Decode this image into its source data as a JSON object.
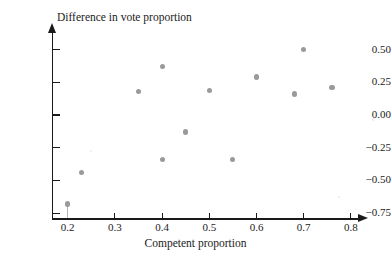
{
  "chart_data": {
    "type": "scatter",
    "title": "",
    "xlabel": "Competent proportion",
    "ylabel": "Difference in vote proportion",
    "xlim": [
      0.17,
      0.83
    ],
    "ylim": [
      -0.78,
      0.6
    ],
    "xticks": [
      "0.2",
      "0.3",
      "0.4",
      "0.5",
      "0.6",
      "0.7",
      "0.8"
    ],
    "xtick_values": [
      0.2,
      0.3,
      0.4,
      0.5,
      0.6,
      0.7,
      0.8
    ],
    "yticks": [
      "0.50",
      "0.25",
      "0.00",
      "−0.25",
      "−0.50",
      "−0.75"
    ],
    "ytick_values": [
      0.5,
      0.25,
      0.0,
      -0.25,
      -0.5,
      -0.75
    ],
    "grid": false,
    "legend": null,
    "marker_color": "#9a9a9e",
    "axis_color": "#1a1a1a",
    "points": [
      {
        "x": 0.2,
        "y": -0.68,
        "stem": true
      },
      {
        "x": 0.23,
        "y": -0.44,
        "stem": false
      },
      {
        "x": 0.35,
        "y": 0.18,
        "stem": false
      },
      {
        "x": 0.4,
        "y": 0.37,
        "stem": false
      },
      {
        "x": 0.4,
        "y": -0.34,
        "stem": false
      },
      {
        "x": 0.45,
        "y": -0.13,
        "stem": false
      },
      {
        "x": 0.5,
        "y": 0.19,
        "stem": false
      },
      {
        "x": 0.55,
        "y": -0.34,
        "stem": false
      },
      {
        "x": 0.6,
        "y": 0.29,
        "stem": false
      },
      {
        "x": 0.68,
        "y": 0.16,
        "stem": false
      },
      {
        "x": 0.7,
        "y": 0.5,
        "stem": false
      },
      {
        "x": 0.76,
        "y": 0.21,
        "stem": false
      }
    ]
  }
}
